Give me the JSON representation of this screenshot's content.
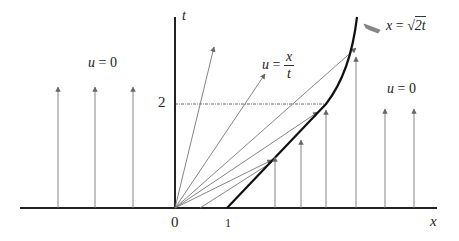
{
  "diagram": {
    "type": "characteristics-diagram",
    "axes": {
      "x_label": "x",
      "t_label": "t",
      "origin_label": "0",
      "x_tick_label": "1",
      "t_tick_label": "2"
    },
    "regions": {
      "left_label_lhs": "u",
      "left_label_eq": "= 0",
      "fan_label_lhs": "u",
      "fan_label_eq": "=",
      "fan_label_num": "x",
      "fan_label_den": "t",
      "right_label_lhs": "u",
      "right_label_eq": "= 0"
    },
    "shock_curve_label": {
      "lhs": "x",
      "eq": "=",
      "sqrt_arg": "2t"
    },
    "colors": {
      "axis": "#222222",
      "shock": "#111111",
      "characteristic": "#777777",
      "dashed": "#444444",
      "arrowhead": "#666666"
    }
  }
}
